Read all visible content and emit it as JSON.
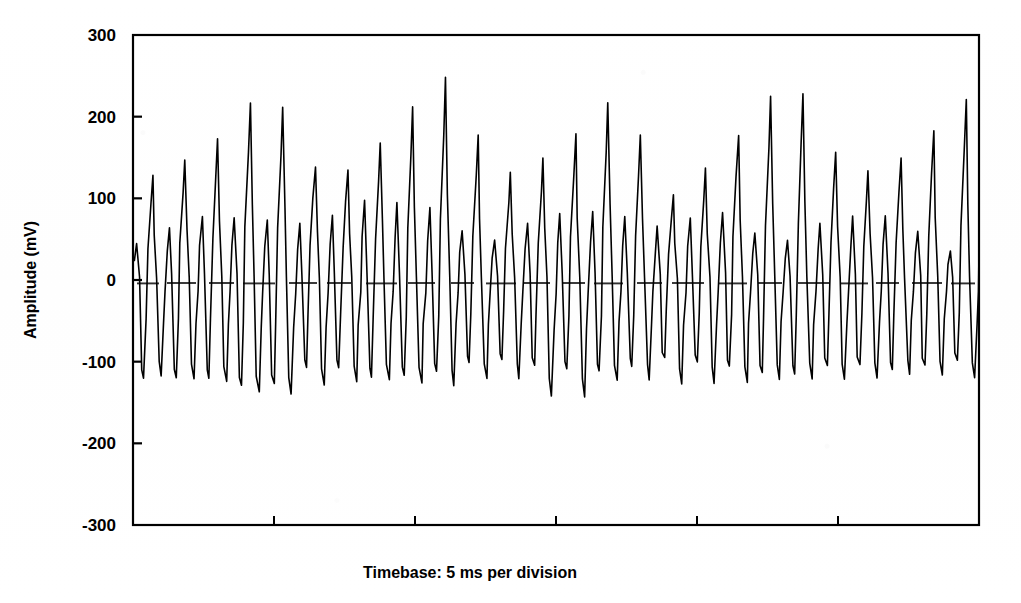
{
  "figure": {
    "name": "amplitude-vs-time-oscillogram",
    "background_color": "#ffffff",
    "trace_color": "#000000",
    "axis_color": "#000000",
    "zero_line_color": "#303030"
  },
  "axes": {
    "y_title": "Amplitude (mV)",
    "x_title": "Timebase: 5 ms per division",
    "y_ticks": [
      "300",
      "200",
      "100",
      "0",
      "-100",
      "-200",
      "-300"
    ],
    "y_tick_values": [
      300,
      200,
      100,
      0,
      -100,
      -200,
      -300
    ],
    "x_tick_count": 5,
    "ylim": [
      -300,
      300
    ],
    "xlim": [
      0,
      30
    ],
    "zero_line": true,
    "zero_line_style": "dashed",
    "grid": false,
    "frame": "box"
  },
  "chart_data": {
    "type": "line",
    "title": "",
    "subtitle": "",
    "xlabel": "Timebase: 5 ms per division",
    "ylabel": "Amplitude (mV)",
    "ylim": [
      -300,
      300
    ],
    "xlim": [
      0,
      30
    ],
    "grid": false,
    "legend": "none",
    "x_units": "ms",
    "y_units": "mV",
    "annotations": [],
    "tick_labels": {
      "y": [
        "300",
        "200",
        "100",
        "0",
        "-100",
        "-200",
        "-300"
      ],
      "x": []
    },
    "series": [
      {
        "name": "amplitude",
        "color": "#000000",
        "description": "Repetitive spiking oscillogram, approximately 26 burst cycles. Each cycle: sharp positive peak, deep negative trough, smaller secondary positive bump.",
        "cycles": [
          {
            "peak": 45,
            "trough": -120,
            "second_peak": 128,
            "second_trough": -118
          },
          {
            "peak": 78,
            "trough": -118,
            "second_peak": 163,
            "second_trough": -122
          },
          {
            "peak": 75,
            "trough": -135,
            "second_peak": 243,
            "second_trough": -145
          },
          {
            "peak": 68,
            "trough": -100,
            "second_peak": 112,
            "second_trough": -125
          },
          {
            "peak": 100,
            "trough": -120,
            "second_peak": 173,
            "second_trough": -122
          },
          {
            "peak": 90,
            "trough": -112,
            "second_peak": 253,
            "second_trough": -130
          },
          {
            "peak": 42,
            "trough": -95,
            "second_peak": 127,
            "second_trough": -115
          },
          {
            "peak": 80,
            "trough": -108,
            "second_peak": 159,
            "second_trough": -152
          },
          {
            "peak": 85,
            "trough": -112,
            "second_peak": 229,
            "second_trough": -118
          },
          {
            "peak": 65,
            "trough": -95,
            "second_peak": 100,
            "second_trough": -128
          },
          {
            "peak": 85,
            "trough": -105,
            "second_peak": 170,
            "second_trough": -125
          },
          {
            "peak": 42,
            "trough": -118,
            "second_peak": 255,
            "second_trough": -120
          },
          {
            "peak": 78,
            "trough": -100,
            "second_peak": 124,
            "second_trough": -122
          },
          {
            "peak": 78,
            "trough": -110,
            "second_peak": 153,
            "second_trough": -115
          },
          {
            "peak": 35,
            "trough": -98,
            "second_peak": 221,
            "second_trough": -120
          }
        ],
        "samples_x": [
          0.0,
          0.18,
          0.35,
          0.52,
          0.7,
          0.9,
          1.1,
          1.3,
          1.55,
          1.8,
          2.05,
          2.28,
          2.5,
          2.72,
          2.95,
          3.18,
          3.42,
          3.68,
          3.9,
          4.15
        ],
        "note": "Waveform rendered procedurally from cycle amplitude envelope."
      }
    ]
  },
  "geometry": {
    "plot_left": 133,
    "plot_right": 979,
    "plot_top": 35,
    "plot_bottom": 525,
    "zero_y": 283
  }
}
